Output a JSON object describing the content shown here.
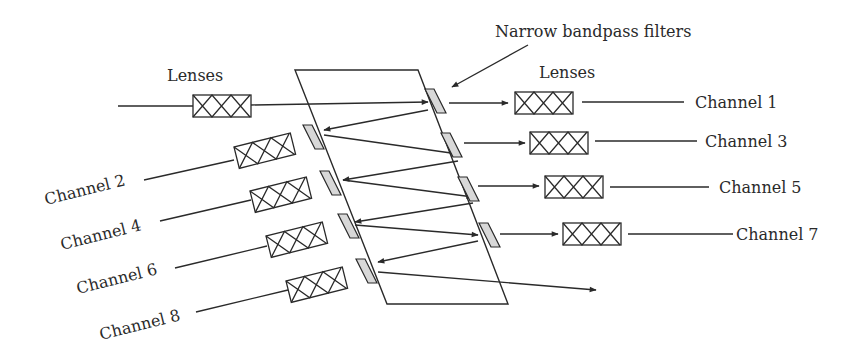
{
  "labels": {
    "lenses_left": "Lenses",
    "lenses_right": "Lenses",
    "filters": "Narrow bandpass filters"
  },
  "channels": {
    "ch1": "Channel 1",
    "ch2": "Channel 2",
    "ch3": "Channel 3",
    "ch4": "Channel 4",
    "ch5": "Channel 5",
    "ch6": "Channel 6",
    "ch7": "Channel 7",
    "ch8": "Channel 8"
  },
  "colors": {
    "line": "#2a2a2a",
    "filter_fill": "#d8d8d8"
  }
}
